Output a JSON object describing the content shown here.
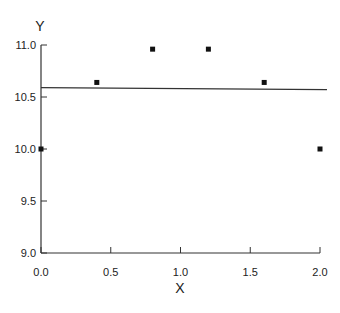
{
  "chart_data": {
    "type": "scatter",
    "title": "",
    "xlabel": "X",
    "ylabel": "Y",
    "xlim": [
      0.0,
      2.0
    ],
    "ylim": [
      9.0,
      11.0
    ],
    "xticks": [
      "0.0",
      "0.5",
      "1.0",
      "1.5",
      "2.0"
    ],
    "yticks": [
      "9.0",
      "9.5",
      "10.0",
      "10.5",
      "11.0"
    ],
    "grid": false,
    "legend": null,
    "series": [
      {
        "name": "data",
        "marker": "square",
        "x": [
          0.0,
          0.4,
          0.8,
          1.2,
          1.6,
          2.0
        ],
        "y": [
          10.0,
          10.64,
          10.96,
          10.96,
          10.64,
          10.0
        ]
      },
      {
        "name": "linear fit",
        "type": "line",
        "x": [
          0.0,
          2.05
        ],
        "y": [
          10.59,
          10.57
        ]
      }
    ]
  }
}
